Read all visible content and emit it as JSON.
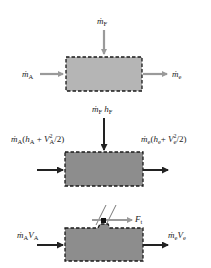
{
  "colors": {
    "panel1_fill": "#b5b5b5",
    "panel2_fill": "#8d8d8d",
    "panel3_fill": "#8d8d8d",
    "panel1_arrow": "#9a9a9a",
    "panel2_arrow": "#222222",
    "panel3_arrow": "#222222",
    "border": "#1a1a1a",
    "force_arrow": "#9a9a9a"
  },
  "panels": [
    {
      "id": "mass-balance",
      "top_label": {
        "m": "ṁ",
        "sub": "F"
      },
      "left_label": {
        "m": "ṁ",
        "sub": "A"
      },
      "right_label": {
        "m": "ṁ",
        "sub": "e"
      }
    },
    {
      "id": "energy-balance",
      "top_label": {
        "m": "ṁ",
        "sub": "F",
        "h": "h",
        "hsub": "F"
      },
      "left_label": {
        "m": "ṁ",
        "sub": "A",
        "open": "(",
        "h": "h",
        "hsub": "A",
        "plus": " + ",
        "V": "V",
        "Vsup": "2",
        "Vsub": "A",
        "tail": "/2)"
      },
      "right_label": {
        "m": "ṁ",
        "sub": "e",
        "open": "(",
        "h": "h",
        "hsub": "e",
        "plus": "+ ",
        "V": "V",
        "Vsup": "2",
        "Vsub": "e",
        "tail": "/2)"
      }
    },
    {
      "id": "momentum-balance",
      "left_label": {
        "m": "ṁ",
        "sub": "A",
        "V": "V",
        "Vsub": "A"
      },
      "right_label": {
        "m": "ṁ",
        "sub": "e",
        "V": "V",
        "Vsub": "e"
      },
      "force_label": {
        "F": "F",
        "sub": "t"
      }
    }
  ]
}
